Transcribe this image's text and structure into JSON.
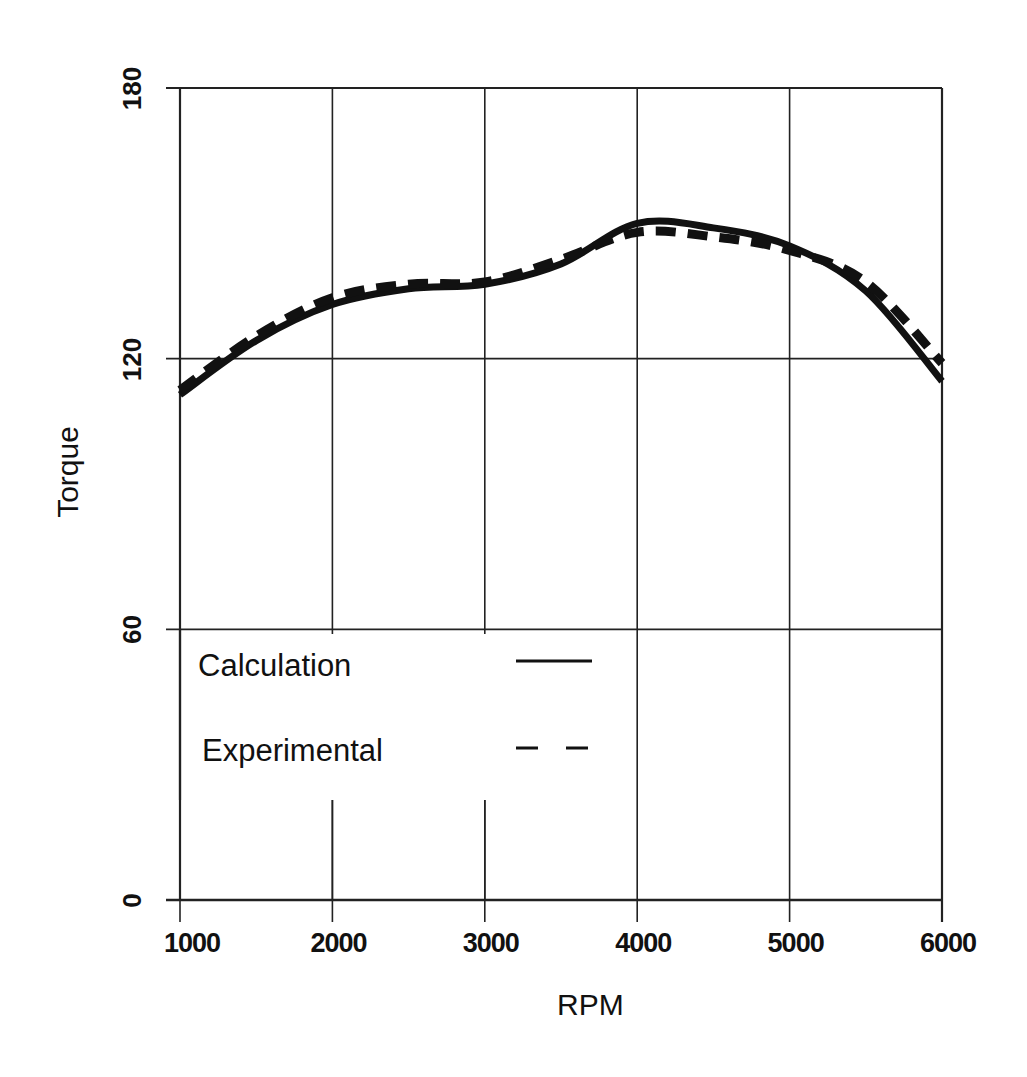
{
  "chart_data": {
    "type": "line",
    "title": "",
    "xlabel": "RPM",
    "ylabel": "Torque",
    "xlim": [
      1000,
      6000
    ],
    "ylim": [
      0,
      180
    ],
    "x_ticks": [
      1000,
      2000,
      3000,
      4000,
      5000,
      6000
    ],
    "y_ticks": [
      0,
      60,
      120,
      180
    ],
    "x_tick_labels": [
      "1000",
      "2000",
      "3000",
      "4000",
      "5000",
      "6000"
    ],
    "y_tick_labels": [
      "0",
      "60",
      "120",
      "180"
    ],
    "grid": true,
    "legend_position": "inside lower-left",
    "x": [
      1000,
      1500,
      2000,
      2500,
      3000,
      3500,
      4000,
      4500,
      5000,
      5500,
      6000
    ],
    "series": [
      {
        "name": "Calculation",
        "style": "solid",
        "values": [
          112,
          124,
          132,
          135.5,
          136.5,
          141,
          150,
          149,
          145,
          135,
          115
        ]
      },
      {
        "name": "Experimental",
        "style": "dashed",
        "values": [
          113,
          125,
          133.5,
          136.5,
          137,
          142,
          148,
          147,
          144,
          137,
          119
        ]
      }
    ]
  },
  "legend": {
    "items": [
      {
        "label": "Calculation",
        "style": "solid"
      },
      {
        "label": "Experimental",
        "style": "dashed"
      }
    ]
  },
  "colors": {
    "line": "#111111",
    "grid": "#222222",
    "background": "#ffffff"
  }
}
